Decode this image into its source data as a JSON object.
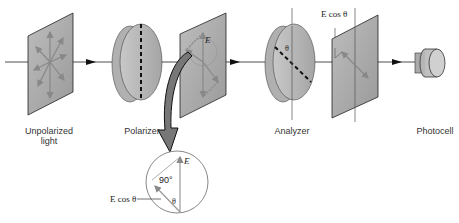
{
  "diagram": {
    "labels": {
      "unpolarized": "Unpolarized light",
      "unpolarized_line1": "Unpolarized",
      "unpolarized_line2": "light",
      "polarizer": "Polarizer",
      "analyzer": "Analyzer",
      "photocell": "Photocell"
    },
    "annotations": {
      "E": "E",
      "E_cos_theta_top": "E cos θ",
      "theta_analyzer": "θ",
      "inset_E": "E",
      "inset_angle": "90°",
      "inset_E_cos_theta": "E cos θ",
      "inset_theta": "θ"
    },
    "colors": {
      "panel_fill": "#a8a8a8",
      "panel_edge": "#222222",
      "disc_fill": "#b8b8b8",
      "arrow_gray": "#888888",
      "big_arrow": "#777777"
    }
  }
}
